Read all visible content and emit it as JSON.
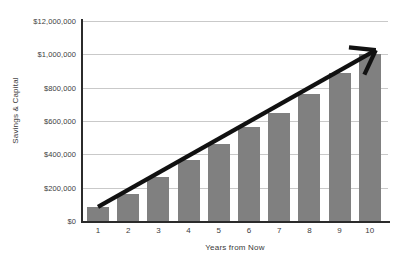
{
  "chart_data": {
    "type": "bar",
    "title": "",
    "xlabel": "Years from Now",
    "ylabel": "Savings & Capital",
    "categories": [
      "1",
      "2",
      "3",
      "4",
      "5",
      "6",
      "7",
      "8",
      "9",
      "10"
    ],
    "values": [
      85000,
      160000,
      265000,
      365000,
      465000,
      565000,
      650000,
      760000,
      890000,
      1000000
    ],
    "series": [
      {
        "name": "Savings & Capital",
        "values": [
          85000,
          160000,
          265000,
          365000,
          465000,
          565000,
          650000,
          760000,
          890000,
          1000000
        ],
        "color": "#808080"
      }
    ],
    "ylim": [
      0,
      1200000
    ],
    "ytick_values": [
      0,
      200000,
      400000,
      600000,
      800000,
      1000000,
      1200000
    ],
    "ytick_labels": [
      "$0",
      "$200,000",
      "$400,000",
      "$600,000",
      "$800,000",
      "$1,000,000",
      "$12,000,000"
    ],
    "grid": true,
    "legend": null,
    "annotations": [
      {
        "type": "arrow",
        "name": "growth-trend-arrow",
        "color": "#111111",
        "from": {
          "x": 1,
          "y": 85000
        },
        "to": {
          "x": 10,
          "y": 1025000
        }
      }
    ]
  },
  "colors": {
    "bar": "#808080",
    "grid": "#c9c9c9",
    "axis": "#2b2b2b",
    "arrow": "#111111",
    "text": "#3d3d3d",
    "background": "#ffffff"
  }
}
